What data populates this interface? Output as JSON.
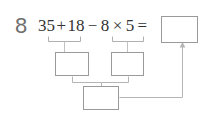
{
  "problem": {
    "number": "8",
    "expression": "35 + 18 − 8 × 5 ="
  },
  "boxes": {
    "answer": "",
    "step_left": "",
    "step_right": "",
    "step_bottom": ""
  },
  "colors": {
    "page_background": "#ffffff",
    "number_gray": "#6f6f6f",
    "text_dark": "#333333",
    "box_border": "#9a9a9a",
    "connector": "#b5b5b5"
  }
}
